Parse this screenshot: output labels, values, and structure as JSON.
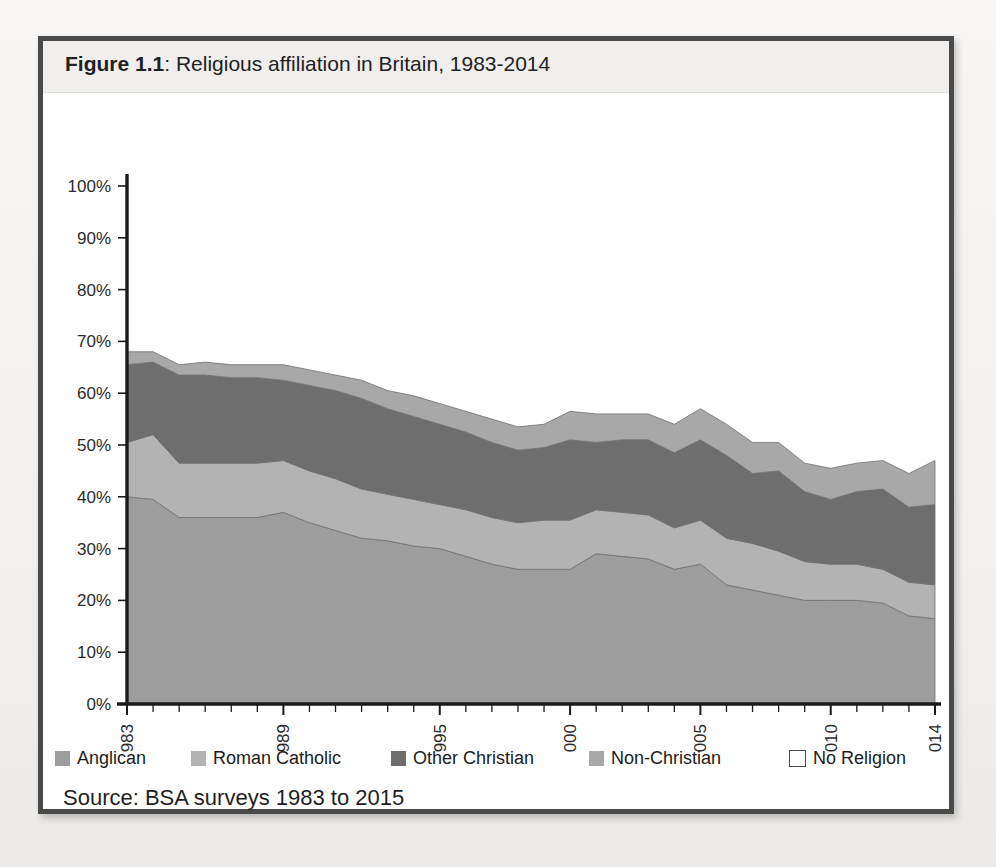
{
  "figure": {
    "number_label": "Figure 1.1",
    "separator": ": ",
    "title_text": "Religious affiliation in Britain, 1983-2014",
    "full_title": "Figure 1.1: Religious affiliation in Britain, 1983-2014",
    "source": "Source: BSA surveys 1983 to 2015",
    "border_color": "#4a4a4a",
    "caption_background": "#f0efed"
  },
  "legend": {
    "position": "bottom",
    "items": [
      {
        "label": "Anglican",
        "color": "#9d9d9d",
        "style": "filled",
        "name": "legend-anglican"
      },
      {
        "label": "Roman Catholic",
        "color": "#b3b3b3",
        "style": "filled",
        "name": "legend-roman-catholic"
      },
      {
        "label": "Other Christian",
        "color": "#6e6e6e",
        "style": "filled",
        "name": "legend-other-christian"
      },
      {
        "label": "Non-Christian",
        "color": "#a8a8a8",
        "style": "filled",
        "name": "legend-non-christian"
      },
      {
        "label": "No Religion",
        "color": "#ffffff",
        "style": "outline",
        "name": "legend-no-religion"
      }
    ]
  },
  "chart_data": {
    "type": "area",
    "stacked": true,
    "title": "Religious affiliation in Britain, 1983-2014",
    "xlabel": "",
    "ylabel": "",
    "ylim": [
      0,
      100
    ],
    "yticks": [
      "0%",
      "10%",
      "20%",
      "30%",
      "40%",
      "50%",
      "60%",
      "70%",
      "80%",
      "90%",
      "100%"
    ],
    "ytick_values": [
      0,
      10,
      20,
      30,
      40,
      50,
      60,
      70,
      80,
      90,
      100
    ],
    "grid": false,
    "xtick_labels": [
      "1983",
      "1989",
      "1995",
      "2000",
      "2005",
      "2010",
      "2014"
    ],
    "xtick_years": [
      1983,
      1989,
      1995,
      2000,
      2005,
      2010,
      2014
    ],
    "x": [
      1983,
      1984,
      1985,
      1986,
      1987,
      1988,
      1989,
      1990,
      1991,
      1992,
      1993,
      1994,
      1995,
      1996,
      1997,
      1998,
      1999,
      2000,
      2001,
      2002,
      2003,
      2004,
      2005,
      2006,
      2007,
      2008,
      2009,
      2010,
      2011,
      2012,
      2013,
      2014
    ],
    "x_note": "annual BSA surveys; 1988 and 1992 not surveyed (interpolated)",
    "series": [
      {
        "name": "Anglican",
        "color": "#9d9d9d",
        "values": [
          40,
          39.5,
          36,
          36,
          36,
          36,
          37,
          35,
          33.5,
          32,
          31.5,
          30.5,
          30,
          28.5,
          27,
          26,
          26,
          26,
          29,
          28.5,
          28,
          26,
          27,
          23,
          22,
          21,
          20,
          20,
          20,
          19.5,
          17,
          16.5
        ]
      },
      {
        "name": "Roman Catholic",
        "color": "#b3b3b3",
        "values": [
          10.5,
          12.5,
          10.5,
          10.5,
          10.5,
          10.5,
          10,
          10,
          10,
          9.5,
          9,
          9,
          8.5,
          9,
          9,
          9,
          9.5,
          9.5,
          8.5,
          8.5,
          8.5,
          8,
          8.5,
          9,
          9,
          8.5,
          7.5,
          7,
          7,
          6.5,
          6.5,
          6.5
        ]
      },
      {
        "name": "Other Christian",
        "color": "#6e6e6e",
        "values": [
          15,
          14,
          17,
          17,
          16.5,
          16.5,
          15.5,
          16.5,
          17,
          17.5,
          16.5,
          16,
          15.5,
          15,
          14.5,
          14,
          14,
          15.5,
          13,
          14,
          14.5,
          14.5,
          15.5,
          16,
          13.5,
          15.5,
          13.5,
          12.5,
          14,
          15.5,
          14.5,
          15.5
        ]
      },
      {
        "name": "Non-Christian",
        "color": "#a8a8a8",
        "values": [
          2.5,
          2,
          2,
          2.5,
          2.5,
          2.5,
          3,
          3,
          3,
          3.5,
          3.5,
          4,
          4,
          4,
          4.5,
          4.5,
          4.5,
          5.5,
          5.5,
          5,
          5,
          5.5,
          6,
          6,
          6,
          5.5,
          5.5,
          6,
          5.5,
          5.5,
          6.5,
          8.5
        ]
      },
      {
        "name": "No Religion",
        "color": "#ffffff",
        "values": [
          32,
          32,
          34.5,
          34,
          34.5,
          34.5,
          34.5,
          35.5,
          36.5,
          37.5,
          39.5,
          40.5,
          42,
          43.5,
          45,
          46.5,
          46,
          43.5,
          44,
          44,
          44,
          46,
          43,
          46,
          49.5,
          49.5,
          53.5,
          54.5,
          53.5,
          53,
          55.5,
          53
        ]
      }
    ],
    "cumulative_tops": {
      "anglican": [
        40,
        39.5,
        36,
        36,
        36,
        36,
        37,
        35,
        33.5,
        32,
        31.5,
        30.5,
        30,
        28.5,
        27,
        26,
        26,
        26,
        29,
        28.5,
        28,
        26,
        27,
        23,
        22,
        21,
        20,
        20,
        20,
        19.5,
        17,
        16.5
      ],
      "roman_catholic": [
        50.5,
        52,
        46.5,
        46.5,
        46.5,
        46.5,
        47,
        45,
        43.5,
        41.5,
        40.5,
        39.5,
        38.5,
        37.5,
        36,
        35,
        35.5,
        35.5,
        37.5,
        37,
        36.5,
        34,
        35.5,
        32,
        31,
        29.5,
        27.5,
        27,
        27,
        26,
        23.5,
        23
      ],
      "other_christian": [
        65.5,
        66,
        63.5,
        63.5,
        63,
        63,
        62.5,
        61.5,
        60.5,
        59,
        57,
        55.5,
        54,
        52.5,
        50.5,
        49,
        49.5,
        51,
        50.5,
        51,
        51,
        48.5,
        51,
        48,
        44.5,
        45,
        41,
        39.5,
        41,
        41.5,
        38,
        38.5
      ],
      "non_christian": [
        68,
        68,
        65.5,
        66,
        65.5,
        65.5,
        65.5,
        64.5,
        63.5,
        62.5,
        60.5,
        59.5,
        58,
        56.5,
        55,
        53.5,
        54,
        56.5,
        56,
        56,
        56,
        54,
        57,
        54,
        50.5,
        50.5,
        46.5,
        45.5,
        46.5,
        47,
        44.5,
        47
      ]
    }
  },
  "axes": {
    "y_axis_name": "percentage-axis",
    "x_axis_name": "year-axis",
    "x_label_rotation": "-90"
  }
}
